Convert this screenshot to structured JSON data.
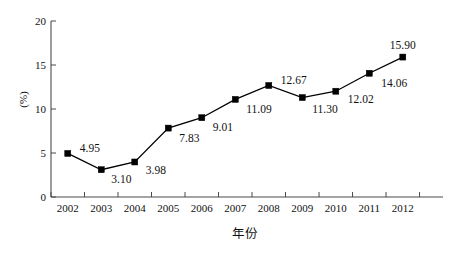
{
  "chart_data": {
    "type": "line",
    "title": "",
    "xlabel": "年份",
    "ylabel": "(%)",
    "categories": [
      "2002",
      "2003",
      "2004",
      "2005",
      "2006",
      "2007",
      "2008",
      "2009",
      "2010",
      "2011",
      "2012"
    ],
    "values": [
      4.95,
      3.1,
      3.98,
      7.83,
      9.01,
      11.09,
      12.67,
      11.3,
      12.02,
      14.06,
      15.9
    ],
    "point_labels": [
      "4.95",
      "3.10",
      "3.98",
      "7.83",
      "9.01",
      "11.09",
      "12.67",
      "11.30",
      "12.02",
      "14.06",
      "15.90"
    ],
    "ylim": [
      0,
      20
    ],
    "yticks": [
      0,
      5,
      10,
      15,
      20
    ],
    "ytick_labels": [
      "0",
      "5",
      "10",
      "15",
      "20"
    ],
    "grid": false,
    "legend": "none",
    "marker": "square",
    "marker_color": "#000000",
    "line_color": "#000000",
    "background": "#ffffff",
    "axis_color": "#4a4a4a"
  },
  "label_offsets": [
    {
      "dx": 12,
      "dy": -4
    },
    {
      "dx": 10,
      "dy": 10
    },
    {
      "dx": 11,
      "dy": 9
    },
    {
      "dx": 11,
      "dy": 11
    },
    {
      "dx": 11,
      "dy": 10
    },
    {
      "dx": 11,
      "dy": 11
    },
    {
      "dx": 12,
      "dy": -5
    },
    {
      "dx": 10,
      "dy": 12
    },
    {
      "dx": 12,
      "dy": 9
    },
    {
      "dx": 12,
      "dy": 11
    },
    {
      "dx": 0,
      "dy": -11
    }
  ]
}
